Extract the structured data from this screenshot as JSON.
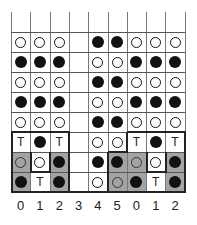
{
  "diagram": {
    "columns": 9,
    "column_labels": [
      "0",
      "1",
      "2",
      "3",
      "4",
      "5",
      "0",
      "1",
      "2"
    ],
    "legend": {
      "O": "open circle",
      "X": "filled circle",
      "T": "letter T",
      "": "empty"
    },
    "colors": {
      "shade": "#a3a3a3",
      "line": "#555555",
      "ink": "#111111"
    },
    "rows": [
      [
        "O",
        "O",
        "O",
        "",
        "X",
        "X",
        "O",
        "O",
        "O"
      ],
      [
        "X",
        "X",
        "X",
        "",
        "O",
        "O",
        "X",
        "X",
        "X"
      ],
      [
        "O",
        "O",
        "O",
        "",
        "X",
        "X",
        "O",
        "O",
        "O"
      ],
      [
        "X",
        "X",
        "X",
        "",
        "O",
        "O",
        "X",
        "X",
        "X"
      ],
      [
        "O",
        "O",
        "O",
        "",
        "X",
        "X",
        "O",
        "O",
        "O"
      ],
      [
        "T",
        "X",
        "T",
        "",
        "O",
        "O",
        "T",
        "X",
        "T"
      ],
      [
        "O",
        "O",
        "X",
        "",
        "X",
        "X",
        "O",
        "O",
        "X"
      ],
      [
        "X",
        "T",
        "X",
        "",
        "O",
        "O",
        "X",
        "T",
        "X"
      ]
    ],
    "shaded": [
      [
        6,
        0
      ],
      [
        6,
        2
      ],
      [
        7,
        0
      ],
      [
        7,
        2
      ],
      [
        6,
        5
      ],
      [
        6,
        6
      ],
      [
        6,
        8
      ],
      [
        7,
        5
      ],
      [
        7,
        6
      ],
      [
        7,
        8
      ]
    ]
  }
}
